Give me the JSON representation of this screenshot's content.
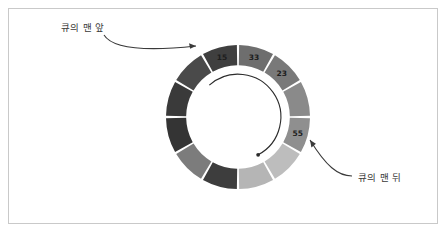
{
  "figure": {
    "background_color": "#ffffff",
    "frame_color": "#c9c9c9"
  },
  "annotations": {
    "front": {
      "text": "큐의 맨 앞",
      "icon": "arrow-curved-icon",
      "color": "#3a3a3a"
    },
    "back": {
      "text": "큐의 맨 뒤",
      "icon": "arrow-curved-icon",
      "color": "#3a3a3a"
    },
    "direction_arrow": {
      "icon": "circular-direction-arrow-icon",
      "color": "#2b2b2b"
    }
  },
  "chart_data": {
    "type": "pie",
    "title": "",
    "subtitle": "",
    "xlabel": "",
    "ylabel": "",
    "legend_position": "none",
    "grid": false,
    "inner_radius_ratio": 0.72,
    "outer_radius": 72,
    "center": [
      238,
      117
    ],
    "start_angle_deg": -90,
    "slice_count": 12,
    "equal_slices": true,
    "slice_sweep_deg": 30,
    "categories": [
      "slot-0",
      "slot-1",
      "slot-2",
      "slot-3",
      "slot-4",
      "slot-5",
      "slot-6",
      "slot-7",
      "slot-8",
      "slot-9",
      "slot-10",
      "slot-11"
    ],
    "values": [
      30,
      30,
      30,
      30,
      30,
      30,
      30,
      30,
      30,
      30,
      30,
      30
    ],
    "slices": [
      {
        "index": 0,
        "label": "33",
        "color": "#6e6e6e",
        "has_label": true
      },
      {
        "index": 1,
        "label": "23",
        "color": "#797979",
        "has_label": true
      },
      {
        "index": 2,
        "label": "",
        "color": "#8a8a8a",
        "has_label": false
      },
      {
        "index": 3,
        "label": "55",
        "color": "#8f8f8f",
        "has_label": true
      },
      {
        "index": 4,
        "label": "",
        "color": "#bdbdbd",
        "has_label": false
      },
      {
        "index": 5,
        "label": "",
        "color": "#b5b5b5",
        "has_label": false
      },
      {
        "index": 6,
        "label": "",
        "color": "#3d3d3d",
        "has_label": false
      },
      {
        "index": 7,
        "label": "",
        "color": "#7c7c7c",
        "has_label": false
      },
      {
        "index": 8,
        "label": "",
        "color": "#343434",
        "has_label": false
      },
      {
        "index": 9,
        "label": "",
        "color": "#3a3a3a",
        "has_label": false
      },
      {
        "index": 10,
        "label": "",
        "color": "#4a4a4a",
        "has_label": false
      },
      {
        "index": 11,
        "label": "15",
        "color": "#3f3f3f",
        "has_label": true
      }
    ],
    "labeled_values": [
      "15",
      "33",
      "23",
      "55"
    ],
    "separator_color": "#ffffff"
  }
}
